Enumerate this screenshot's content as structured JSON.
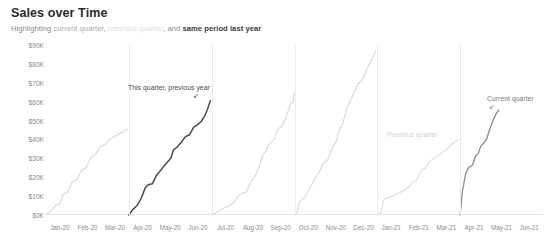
{
  "header": {
    "title": "Sales over Time",
    "subtitle_parts": [
      {
        "text": "Highlighting ",
        "style": "normal"
      },
      {
        "text": "current quarter",
        "style": "mid"
      },
      {
        "text": ", ",
        "style": "normal"
      },
      {
        "text": "previous quarter",
        "style": "light"
      },
      {
        "text": ", and ",
        "style": "normal"
      },
      {
        "text": "same period last year",
        "style": "dark"
      }
    ]
  },
  "annotations": [
    {
      "name": "this-quarter-previous-year",
      "text": "This quarter, previous year",
      "x": 128,
      "y": 84,
      "tone": "dark"
    },
    {
      "name": "previous-quarter",
      "text": "Previous quarter",
      "x": 387,
      "y": 131,
      "tone": "faint"
    },
    {
      "name": "current-quarter",
      "text": "Current quarter",
      "x": 487,
      "y": 95,
      "tone": "mid"
    }
  ],
  "chart_data": {
    "type": "line",
    "title": "Sales over Time",
    "subtitle": "Highlighting current quarter, previous quarter, and same period last year",
    "xlabel": "",
    "ylabel": "",
    "ylim": [
      0,
      90000
    ],
    "ytick_labels": [
      "$90K",
      "$80K",
      "$70K",
      "$60K",
      "$50K",
      "$40K",
      "$30K",
      "$20K",
      "$10K",
      "$0K"
    ],
    "ytick_values": [
      90000,
      80000,
      70000,
      60000,
      50000,
      40000,
      30000,
      20000,
      10000,
      0
    ],
    "xtick_labels": [
      "Jan-20",
      "Feb-20",
      "Mar-20",
      "Apr-20",
      "May-20",
      "Jun-20",
      "Jul-20",
      "Aug-20",
      "Sep-20",
      "Oct-20",
      "Nov-20",
      "Dec-20",
      "Jan-21",
      "Feb-21",
      "Mar-21",
      "Apr-21",
      "May-21",
      "Jun-21"
    ],
    "grid": "vertical-quarter-boundaries",
    "legend": "annotations-inline",
    "note": "Cumulative running sales total that resets each calendar quarter",
    "colors": {
      "default_line": "#d8d8d8",
      "highlight_same_period_last_year": "#4a4a4a",
      "highlight_previous_quarter": "#e0e0e0",
      "highlight_current_quarter": "#8e8e8e",
      "gridline": "#ececec",
      "axis_text": "#8d8d8d"
    },
    "series": [
      {
        "name": "Q1 2020",
        "emphasis": "default",
        "points": [
          [
            0,
            0
          ],
          [
            0.18,
            2200
          ],
          [
            0.35,
            5200
          ],
          [
            0.5,
            6000
          ],
          [
            0.62,
            11000
          ],
          [
            0.78,
            12000
          ],
          [
            0.95,
            17500
          ],
          [
            1.1,
            18500
          ],
          [
            1.3,
            24000
          ],
          [
            1.45,
            25000
          ],
          [
            1.62,
            30500
          ],
          [
            1.8,
            32000
          ],
          [
            1.95,
            36000
          ],
          [
            2.15,
            37500
          ],
          [
            2.35,
            40500
          ],
          [
            2.6,
            42500
          ],
          [
            2.8,
            44000
          ],
          [
            2.95,
            45500
          ]
        ]
      },
      {
        "name": "Q2 2020 (same period last year)",
        "emphasis": "same-period-last-year",
        "points": [
          [
            3,
            0
          ],
          [
            3.15,
            3000
          ],
          [
            3.3,
            5000
          ],
          [
            3.45,
            9000
          ],
          [
            3.6,
            14500
          ],
          [
            3.7,
            16000
          ],
          [
            3.85,
            16500
          ],
          [
            4.0,
            21000
          ],
          [
            4.12,
            23000
          ],
          [
            4.25,
            25500
          ],
          [
            4.4,
            28000
          ],
          [
            4.52,
            30000
          ],
          [
            4.62,
            34500
          ],
          [
            4.75,
            36000
          ],
          [
            4.9,
            38500
          ],
          [
            5.05,
            41500
          ],
          [
            5.2,
            42500
          ],
          [
            5.35,
            46500
          ],
          [
            5.5,
            48000
          ],
          [
            5.62,
            49500
          ],
          [
            5.75,
            52500
          ],
          [
            5.85,
            56000
          ],
          [
            5.95,
            60500
          ]
        ]
      },
      {
        "name": "Q3 2020",
        "emphasis": "default",
        "points": [
          [
            6,
            0
          ],
          [
            6.2,
            1500
          ],
          [
            6.4,
            3500
          ],
          [
            6.6,
            4500
          ],
          [
            6.8,
            6500
          ],
          [
            6.95,
            10000
          ],
          [
            7.1,
            11500
          ],
          [
            7.25,
            12000
          ],
          [
            7.4,
            17000
          ],
          [
            7.55,
            20000
          ],
          [
            7.7,
            24500
          ],
          [
            7.85,
            32000
          ],
          [
            7.95,
            33500
          ],
          [
            8.1,
            38000
          ],
          [
            8.25,
            39500
          ],
          [
            8.4,
            45500
          ],
          [
            8.55,
            47000
          ],
          [
            8.7,
            52000
          ],
          [
            8.85,
            58500
          ],
          [
            8.95,
            60000
          ],
          [
            9.0,
            64500
          ]
        ]
      },
      {
        "name": "Q4 2020",
        "emphasis": "default",
        "points": [
          [
            9,
            0
          ],
          [
            9.1,
            1500
          ],
          [
            9.2,
            7500
          ],
          [
            9.35,
            9000
          ],
          [
            9.5,
            13000
          ],
          [
            9.65,
            16500
          ],
          [
            9.78,
            20500
          ],
          [
            9.9,
            23000
          ],
          [
            10.05,
            27500
          ],
          [
            10.2,
            29000
          ],
          [
            10.35,
            35000
          ],
          [
            10.5,
            38500
          ],
          [
            10.62,
            45000
          ],
          [
            10.75,
            48500
          ],
          [
            10.9,
            56500
          ],
          [
            11.0,
            60000
          ],
          [
            11.15,
            64500
          ],
          [
            11.3,
            69500
          ],
          [
            11.45,
            71500
          ],
          [
            11.6,
            76500
          ],
          [
            11.8,
            82500
          ],
          [
            11.95,
            87000
          ]
        ]
      },
      {
        "name": "Q1 2021 (previous quarter)",
        "emphasis": "previous-quarter",
        "points": [
          [
            12,
            0
          ],
          [
            12.12,
            1000
          ],
          [
            12.25,
            8500
          ],
          [
            12.45,
            9500
          ],
          [
            12.7,
            11000
          ],
          [
            12.9,
            12500
          ],
          [
            13.1,
            14500
          ],
          [
            13.3,
            17500
          ],
          [
            13.45,
            19000
          ],
          [
            13.6,
            23500
          ],
          [
            13.75,
            25000
          ],
          [
            13.9,
            28500
          ],
          [
            14.05,
            30000
          ],
          [
            14.2,
            31500
          ],
          [
            14.4,
            33500
          ],
          [
            14.6,
            36000
          ],
          [
            14.8,
            38500
          ],
          [
            14.95,
            40000
          ]
        ]
      },
      {
        "name": "Q2 2021 (current quarter)",
        "emphasis": "current-quarter",
        "points": [
          [
            15,
            0
          ],
          [
            15.08,
            12500
          ],
          [
            15.2,
            22000
          ],
          [
            15.3,
            25000
          ],
          [
            15.45,
            26500
          ],
          [
            15.55,
            31000
          ],
          [
            15.65,
            32500
          ],
          [
            15.75,
            36500
          ],
          [
            15.85,
            38000
          ],
          [
            15.95,
            40000
          ],
          [
            16.05,
            44500
          ],
          [
            16.2,
            50500
          ],
          [
            16.3,
            53500
          ],
          [
            16.4,
            55500
          ]
        ]
      }
    ]
  }
}
